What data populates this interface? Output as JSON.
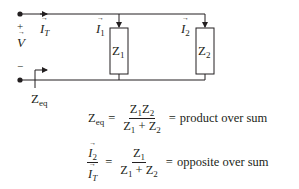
{
  "diagram": {
    "type": "parallel impedance circuit",
    "colors": {
      "line": "#231f20",
      "background": "#ffffff"
    },
    "source": {
      "plus": "+",
      "minus": "−",
      "voltage": "V"
    },
    "currents": {
      "total": {
        "symbol": "I",
        "sub": "T"
      },
      "branch1": {
        "symbol": "I",
        "sub": "1"
      },
      "branch2": {
        "symbol": "I",
        "sub": "2"
      }
    },
    "impedances": [
      {
        "symbol": "Z",
        "sub": "1"
      },
      {
        "symbol": "Z",
        "sub": "2"
      }
    ],
    "zeq_label": {
      "symbol": "Z",
      "sub": "eq"
    }
  },
  "equations": {
    "zeq": {
      "lhs": {
        "symbol": "Z",
        "sub": "eq"
      },
      "eq1": "=",
      "num": {
        "a": "Z",
        "a_sub": "1",
        "b": "Z",
        "b_sub": "2"
      },
      "den": {
        "a": "Z",
        "a_sub": "1",
        "op": "+",
        "b": "Z",
        "b_sub": "2"
      },
      "eq2": "=",
      "rhs_text": "product over sum"
    },
    "divider": {
      "lhs_num": {
        "symbol": "I",
        "sub": "2"
      },
      "lhs_den": {
        "symbol": "I",
        "sub": "T"
      },
      "eq1": "=",
      "num": {
        "a": "Z",
        "a_sub": "1"
      },
      "den": {
        "a": "Z",
        "a_sub": "1",
        "op": "+",
        "b": "Z",
        "b_sub": "2"
      },
      "eq2": "=",
      "rhs_text": "opposite over sum"
    }
  }
}
